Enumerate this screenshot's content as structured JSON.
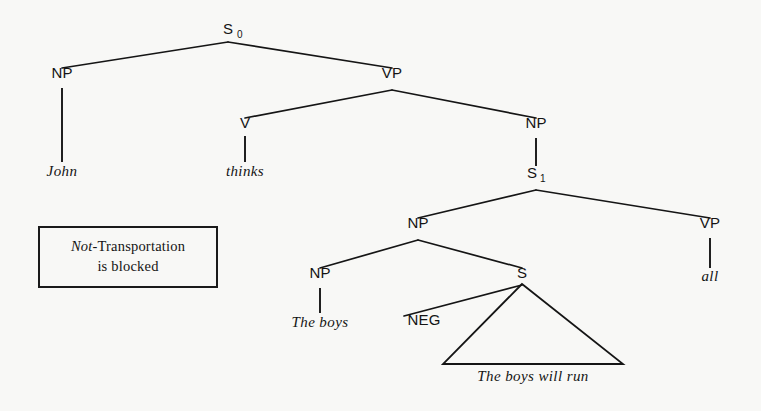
{
  "figure": {
    "kind": "syntax-tree",
    "background_color": "#f8f8f6",
    "ink_color": "#151515"
  },
  "nodes": {
    "s0": {
      "label": "S",
      "subscript": "0",
      "x": 228,
      "y": 34
    },
    "np_subject": {
      "label": "NP",
      "x": 62,
      "y": 78
    },
    "vp_matrix": {
      "label": "VP",
      "x": 392,
      "y": 78
    },
    "v_matrix": {
      "label": "V",
      "x": 245,
      "y": 128
    },
    "np_object": {
      "label": "NP",
      "x": 536,
      "y": 128
    },
    "s1": {
      "label": "S",
      "subscript": "1",
      "x": 536,
      "y": 178
    },
    "np_embedded": {
      "label": "NP",
      "x": 418,
      "y": 228
    },
    "vp_embedded": {
      "label": "VP",
      "x": 710,
      "y": 228
    },
    "np_inner": {
      "label": "NP",
      "x": 320,
      "y": 278
    },
    "s_relative": {
      "label": "S",
      "x": 522,
      "y": 278
    },
    "neg": {
      "label": "NEG",
      "x": 424,
      "y": 325
    }
  },
  "leaves": {
    "john": {
      "text": "John",
      "x": 62,
      "y": 176
    },
    "thinks": {
      "text": "thinks",
      "x": 245,
      "y": 176
    },
    "all": {
      "text": "all",
      "x": 710,
      "y": 281
    },
    "the_boys": {
      "text": "The boys",
      "x": 320,
      "y": 327
    },
    "the_boys_will_run": {
      "text": "The boys will run",
      "x": 533,
      "y": 381
    }
  },
  "triangle": {
    "apex_x": 522,
    "apex_y": 284,
    "base_left_x": 443,
    "base_right_x": 623,
    "base_y": 364
  },
  "annotation_box": {
    "line1_italic": "Not",
    "line1_rest": "-Transportation",
    "line2": "is blocked",
    "x": 38,
    "y": 226,
    "width": 180,
    "height": 62
  }
}
